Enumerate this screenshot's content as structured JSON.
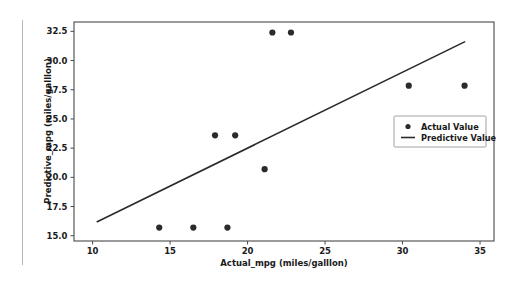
{
  "chart_data": {
    "type": "scatter",
    "title": "",
    "xlabel": "Actual_mpg (miles/galllon)",
    "ylabel": "Predictive_mpg (miles/galllon)",
    "xlim": [
      8.8,
      35.9
    ],
    "ylim": [
      14.55,
      33.3
    ],
    "xticks": [
      10,
      15,
      20,
      25,
      30,
      35
    ],
    "xtick_labels": [
      "10",
      "15",
      "20",
      "25",
      "30",
      "35"
    ],
    "yticks": [
      15.0,
      17.5,
      20.0,
      22.5,
      25.0,
      27.5,
      30.0,
      32.5
    ],
    "ytick_labels": [
      "15.0",
      "17.5",
      "20.0",
      "22.5",
      "25.0",
      "27.5",
      "30.0",
      "32.5"
    ],
    "grid": false,
    "legend_position": "center right",
    "series": [
      {
        "name": "Actual Value",
        "type": "scatter",
        "marker": "circle",
        "color": "#2b2b2b",
        "points": [
          {
            "x": 14.3,
            "y": 15.7
          },
          {
            "x": 16.5,
            "y": 15.7
          },
          {
            "x": 18.7,
            "y": 15.7
          },
          {
            "x": 17.9,
            "y": 23.6
          },
          {
            "x": 19.2,
            "y": 23.6
          },
          {
            "x": 21.1,
            "y": 20.7
          },
          {
            "x": 21.6,
            "y": 32.4
          },
          {
            "x": 22.8,
            "y": 32.4
          },
          {
            "x": 30.4,
            "y": 27.85
          },
          {
            "x": 34.0,
            "y": 27.85
          }
        ]
      },
      {
        "name": "Predictive Value",
        "type": "line",
        "color": "#2b2b2b",
        "points": [
          {
            "x": 10.3,
            "y": 16.2
          },
          {
            "x": 34.0,
            "y": 31.6
          }
        ]
      }
    ]
  },
  "legend": {
    "entries": [
      {
        "label": "Actual Value",
        "marker": "circle"
      },
      {
        "label": "Predictive Value",
        "marker": "line"
      }
    ]
  }
}
